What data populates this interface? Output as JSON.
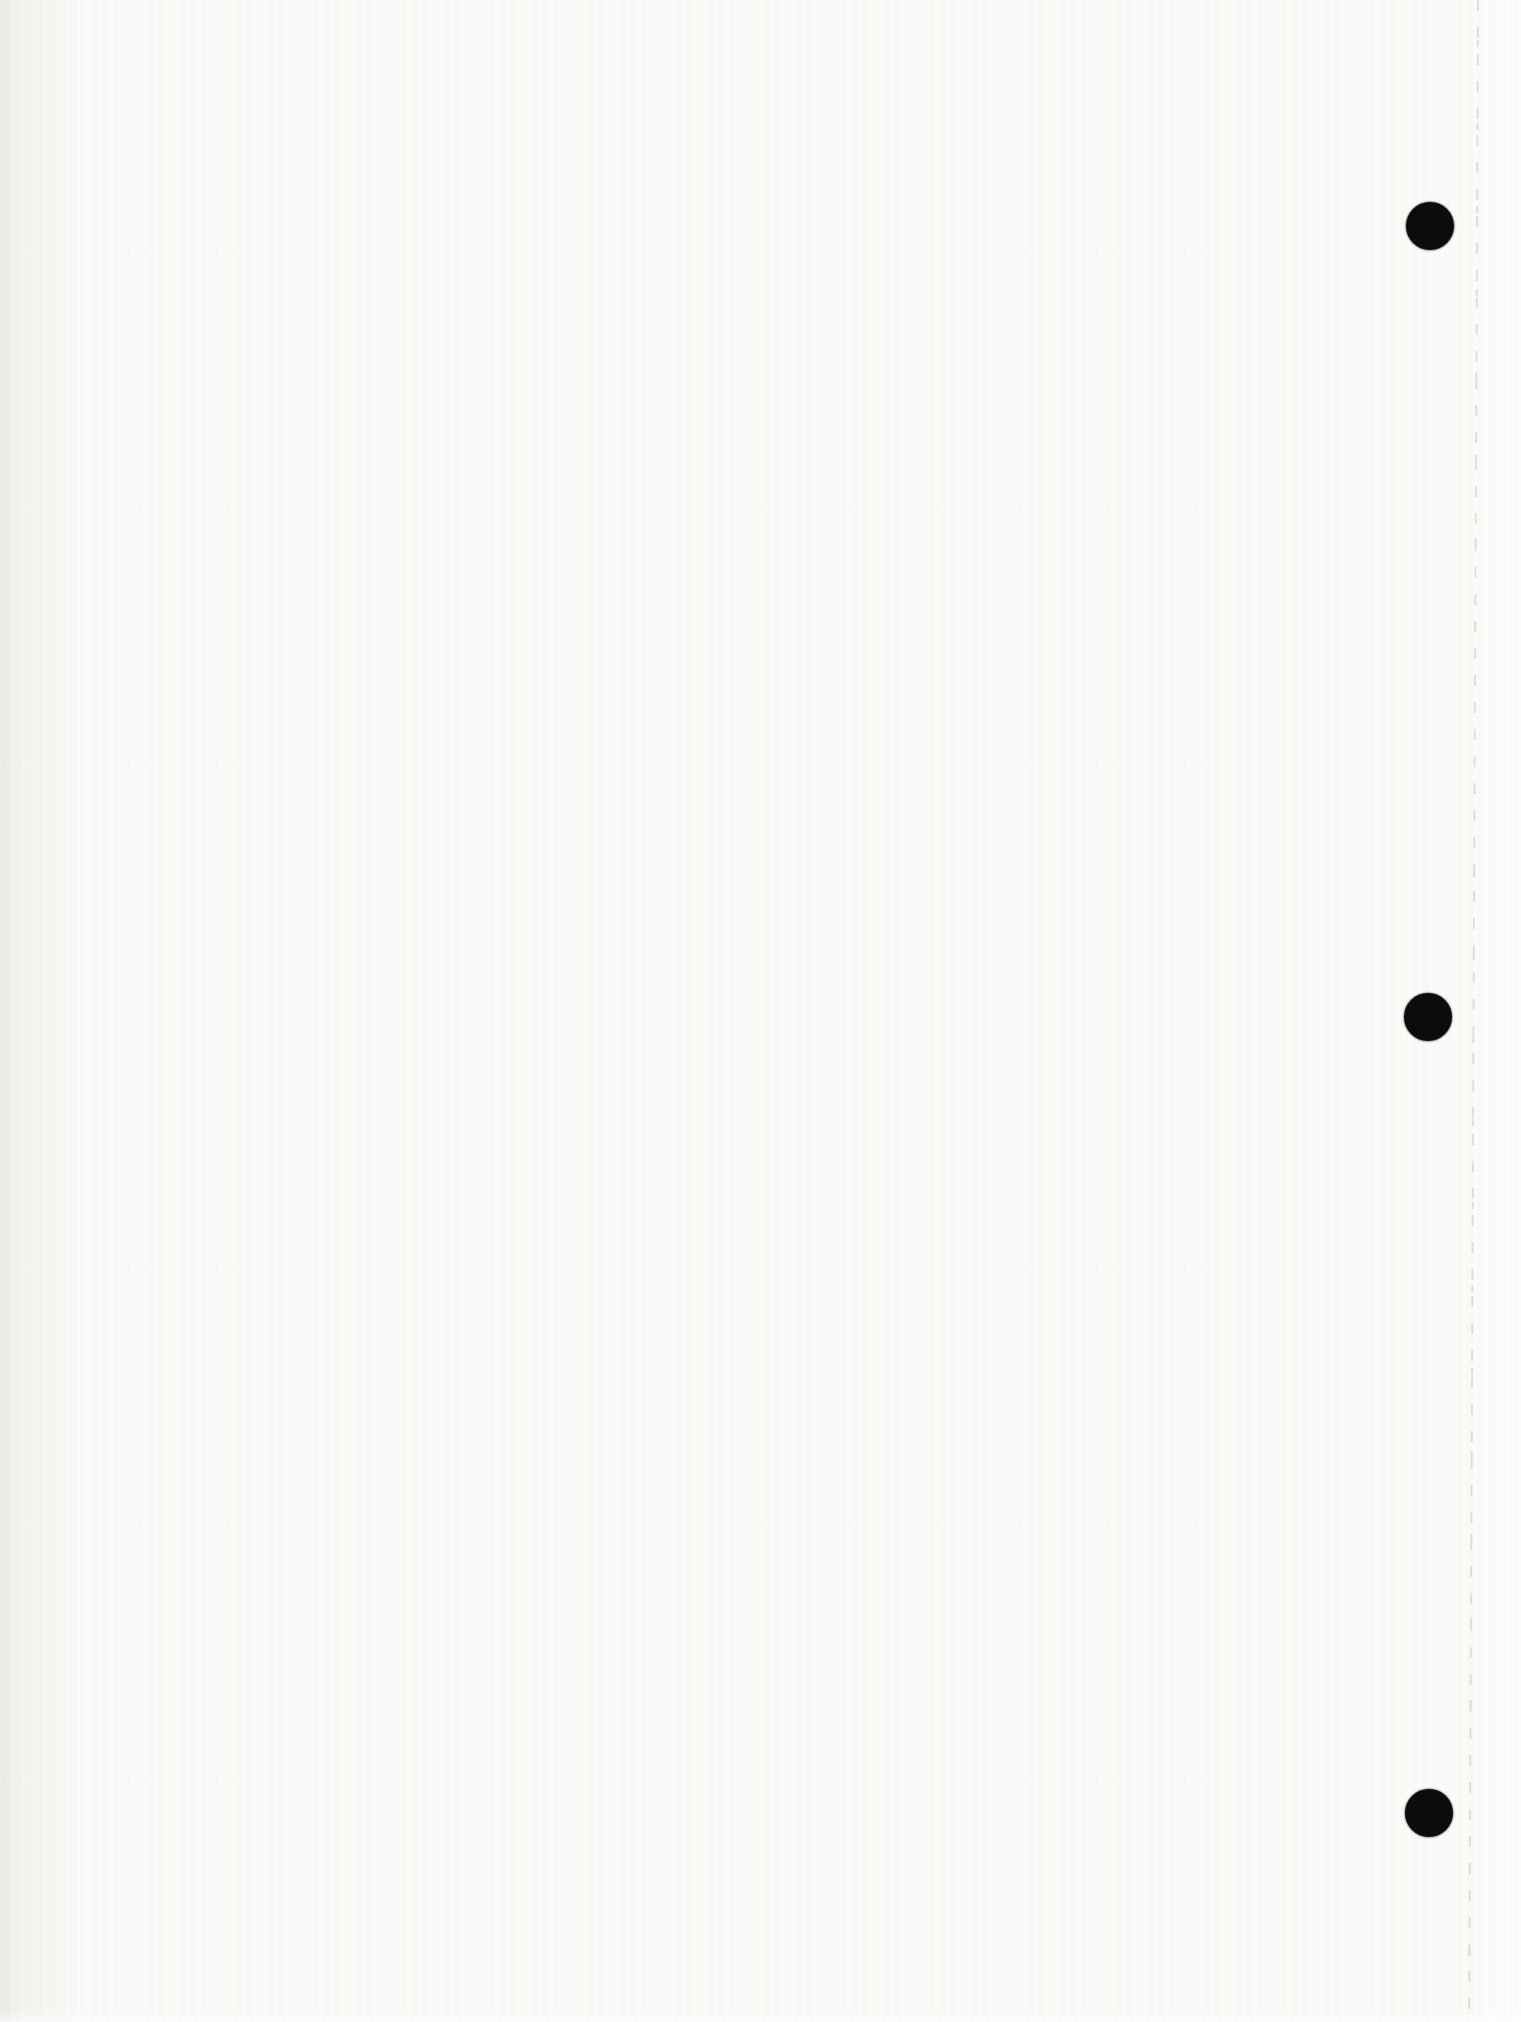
{
  "page": {
    "kind": "blank-scanned-sheet",
    "width": 1521,
    "height": 2022
  },
  "scan": {
    "paper_color": "#fafaf7",
    "edge_strip_color": "rgba(253,253,252,0.6)",
    "perforation_line_color": "#d6d6cf",
    "perforation_line_x_top": 1478,
    "perforation_tilt_deg": 0.25,
    "hole_punch_color": "#0c0c0c",
    "hole_punches": [
      {
        "x": 1430,
        "y": 226,
        "radius": 24
      },
      {
        "x": 1428,
        "y": 1017,
        "radius": 24
      },
      {
        "x": 1429,
        "y": 1813,
        "radius": 24
      }
    ]
  }
}
